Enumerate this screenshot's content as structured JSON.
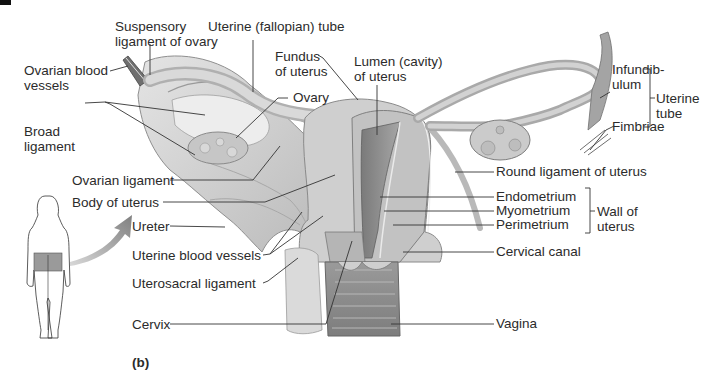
{
  "figure": {
    "panel_label": "(b)",
    "colors": {
      "tissue_light": "#d6d6d6",
      "tissue_mid": "#bdbdbd",
      "tissue_dark": "#8a8a8a",
      "leader_line": "#333333",
      "arrow": "#8c8c8c",
      "highlight_region": "#9a9a9a"
    }
  },
  "labels": {
    "suspensory_ligament": [
      "Suspensory",
      "ligament of ovary"
    ],
    "uterine_tube_top": "Uterine (fallopian) tube",
    "ovarian_blood_vessels": [
      "Ovarian blood",
      "vessels"
    ],
    "fundus": [
      "Fundus",
      "of uterus"
    ],
    "lumen": [
      "Lumen (cavity)",
      "of uterus"
    ],
    "ovary": "Ovary",
    "broad_ligament": [
      "Broad",
      "ligament"
    ],
    "ovarian_ligament": "Ovarian ligament",
    "body_of_uterus": "Body of uterus",
    "ureter": "Ureter",
    "uterine_blood_vessels": "Uterine blood vessels",
    "uterosacral_ligament": "Uterosacral ligament",
    "cervix": "Cervix",
    "infundibulum": [
      "Infundib-",
      "ulum"
    ],
    "fimbriae": "Fimbriae",
    "uterine_tube_group": [
      "Uterine",
      "tube"
    ],
    "round_ligament": "Round ligament of uterus",
    "endometrium": "Endometrium",
    "myometrium": "Myometrium",
    "perimetrium": "Perimetrium",
    "wall_of_uterus": [
      "Wall of",
      "uterus"
    ],
    "cervical_canal": "Cervical canal",
    "vagina": "Vagina"
  },
  "icons": {
    "orientation_figure": "female-body-back-view-icon",
    "pointer_arrow": "curved-arrow-icon"
  }
}
